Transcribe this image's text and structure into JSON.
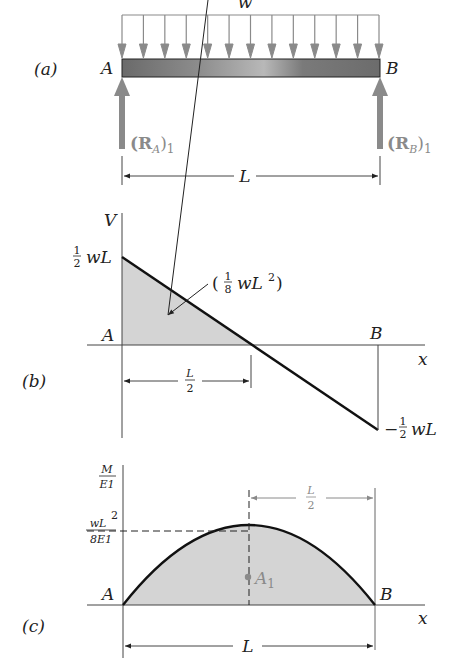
{
  "figure": {
    "part_a": {
      "tag": "(a)",
      "load_label": "w",
      "left_support": "A",
      "right_support": "B",
      "left_reaction": {
        "main": "(R",
        "sub": "A",
        "close": ")",
        "index": "1"
      },
      "right_reaction": {
        "main": "(R",
        "sub": "B",
        "close": ")",
        "index": "1"
      },
      "span_label": "L",
      "load_arrow_count": 13
    },
    "part_b": {
      "tag": "(b)",
      "y_axis": "V",
      "x_axis": "x",
      "left_point": "A",
      "right_point": "B",
      "top_value": {
        "num": "1",
        "den": "2",
        "rest": "wL"
      },
      "bottom_value": {
        "sign": "−",
        "num": "1",
        "den": "2",
        "rest": "wL"
      },
      "area_label": {
        "open": "(",
        "num": "1",
        "den": "8",
        "rest": "wL",
        "exp": "2",
        "close": ")"
      },
      "half_span": {
        "num": "L",
        "den": "2"
      }
    },
    "part_c": {
      "tag": "(c)",
      "y_axis": {
        "num": "M",
        "den": "E1"
      },
      "x_axis": "x",
      "left_point": "A",
      "right_point": "B",
      "peak_value": {
        "num": "wL",
        "exp": "2",
        "den": "8E1"
      },
      "centroid_label": {
        "main": "A",
        "sub": "1"
      },
      "half_span": {
        "num": "L",
        "den": "2"
      },
      "span_label": "L"
    },
    "colors": {
      "line": "#1a1a1a",
      "gray_arrow": "#8a8a8a",
      "fill": "#d4d4d4"
    }
  }
}
